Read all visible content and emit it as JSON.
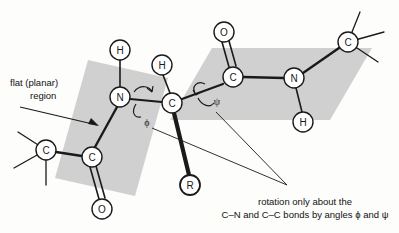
{
  "figure": {
    "type": "molecular-structure-diagram",
    "background_color": "#fdfdfb",
    "plane_fill_color": "#cfcfcf",
    "bond_color": "#1a1a1a",
    "atom_outline_color": "#1a1a1a",
    "atom_fill_color": "#ffffff"
  },
  "annotations": {
    "planar_label_line1": "flat (planar)",
    "planar_label_line2": "region",
    "caption_line1": "rotation only about the",
    "caption_line2": "C–N and C–C bonds by angles ϕ and ψ"
  },
  "angles": {
    "phi": "ϕ",
    "psi": "ψ"
  },
  "atoms": [
    {
      "id": "h-left-amide",
      "label": "H",
      "x": 120,
      "y": 50,
      "r": 10
    },
    {
      "id": "n-left",
      "label": "N",
      "x": 120,
      "y": 97,
      "r": 10
    },
    {
      "id": "c-left-term",
      "label": "C",
      "x": 46,
      "y": 150,
      "r": 10
    },
    {
      "id": "c-carbonyl-left",
      "label": "C",
      "x": 92,
      "y": 157,
      "r": 10
    },
    {
      "id": "o-left",
      "label": "O",
      "x": 102,
      "y": 209,
      "r": 10
    },
    {
      "id": "h-alpha",
      "label": "H",
      "x": 162,
      "y": 65,
      "r": 10
    },
    {
      "id": "c-alpha",
      "label": "C",
      "x": 172,
      "y": 103,
      "r": 10
    },
    {
      "id": "r-group",
      "label": "R",
      "x": 190,
      "y": 185,
      "r": 10
    },
    {
      "id": "o-right",
      "label": "O",
      "x": 224,
      "y": 32,
      "r": 10
    },
    {
      "id": "c-carbonyl-right",
      "label": "C",
      "x": 233,
      "y": 77,
      "r": 10
    },
    {
      "id": "n-right",
      "label": "N",
      "x": 294,
      "y": 78,
      "r": 10
    },
    {
      "id": "h-right-amide",
      "label": "H",
      "x": 303,
      "y": 122,
      "r": 10
    },
    {
      "id": "c-right-term",
      "label": "C",
      "x": 348,
      "y": 42,
      "r": 10
    }
  ],
  "planes": [
    {
      "id": "left-plane",
      "points": "88,60 168,78 135,196 55,178"
    },
    {
      "id": "right-plane",
      "points": "212,48 372,48 330,120 170,120"
    }
  ],
  "label_positions": {
    "planar_label_x": 10,
    "planar_label_y1": 82,
    "planar_label_y2": 95,
    "phi_x": 147,
    "phi_y": 122,
    "psi_x": 217,
    "psi_y": 101,
    "caption_x": 305,
    "caption_y1": 205,
    "caption_y2": 218
  }
}
